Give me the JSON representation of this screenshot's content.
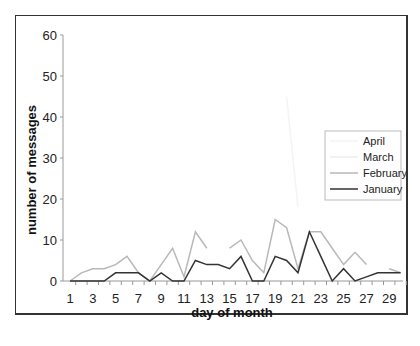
{
  "chart_data": {
    "type": "line",
    "title": "",
    "xlabel": "day of month",
    "ylabel": "number of messages",
    "ylim": [
      0,
      60
    ],
    "yticks": [
      0,
      10,
      20,
      30,
      40,
      50,
      60
    ],
    "xlim": [
      1,
      30
    ],
    "xtick_labels": [
      "1",
      "3",
      "5",
      "7",
      "9",
      "11",
      "13",
      "15",
      "17",
      "19",
      "21",
      "23",
      "25",
      "27",
      "29"
    ],
    "grid": false,
    "legend_position": "right",
    "x": [
      1,
      2,
      3,
      4,
      5,
      6,
      7,
      8,
      9,
      10,
      11,
      12,
      13,
      14,
      15,
      16,
      17,
      18,
      19,
      20,
      21,
      22,
      23,
      24,
      25,
      26,
      27,
      28,
      29,
      30
    ],
    "series": [
      {
        "name": "April",
        "color": "#f4f4f4",
        "values": [
          null,
          null,
          null,
          null,
          null,
          null,
          null,
          null,
          null,
          7,
          null,
          null,
          25,
          null,
          null,
          25,
          null,
          null,
          null,
          45,
          18,
          null,
          null,
          null,
          null,
          null,
          null,
          null,
          null,
          null
        ]
      },
      {
        "name": "March",
        "color": "#eeeeee",
        "values": [
          null,
          null,
          null,
          null,
          null,
          null,
          null,
          null,
          null,
          null,
          null,
          null,
          null,
          null,
          null,
          null,
          null,
          null,
          null,
          null,
          null,
          null,
          null,
          null,
          null,
          null,
          null,
          null,
          null,
          null
        ]
      },
      {
        "name": "February",
        "color": "#b8b8b8",
        "values": [
          0,
          2,
          3,
          3,
          4,
          6,
          2,
          0,
          4,
          8,
          1,
          12,
          8,
          null,
          8,
          10,
          5,
          2,
          15,
          13,
          3,
          12,
          12,
          8,
          4,
          7,
          4,
          null,
          3,
          2
        ]
      },
      {
        "name": "January",
        "color": "#333333",
        "values": [
          0,
          0,
          0,
          0,
          2,
          2,
          2,
          0,
          2,
          0,
          0,
          5,
          4,
          4,
          3,
          6,
          0,
          0,
          6,
          5,
          2,
          12,
          6,
          0,
          3,
          0,
          1,
          2,
          2,
          2
        ]
      }
    ]
  }
}
